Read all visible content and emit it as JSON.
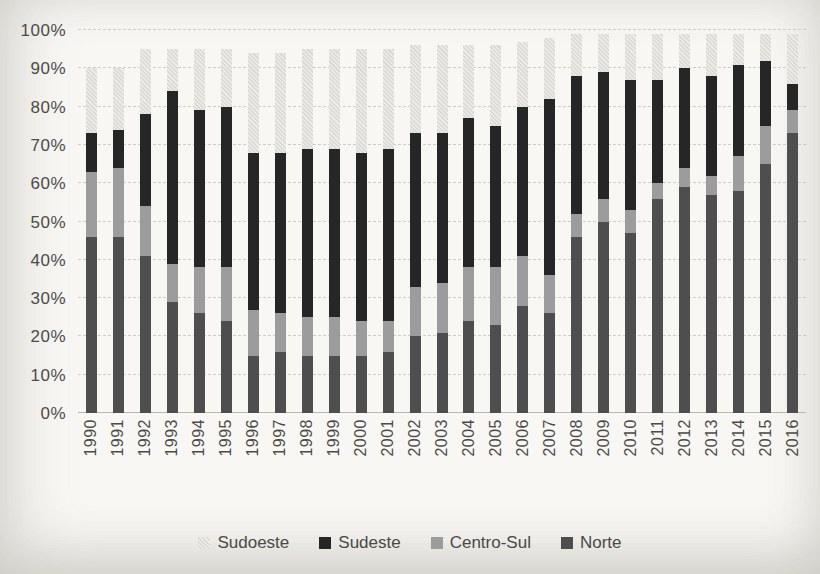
{
  "chart_data": {
    "type": "bar",
    "variant": "stacked-percent",
    "title": "",
    "xlabel": "",
    "ylabel": "",
    "ylim": [
      0,
      100
    ],
    "grid": "horizontal-dashed",
    "legend_position": "bottom",
    "y_ticks": [
      "0%",
      "10%",
      "20%",
      "30%",
      "40%",
      "50%",
      "60%",
      "70%",
      "80%",
      "90%",
      "100%"
    ],
    "categories": [
      "1990",
      "1991",
      "1992",
      "1993",
      "1994",
      "1995",
      "1996",
      "1997",
      "1998",
      "1999",
      "2000",
      "2001",
      "2002",
      "2003",
      "2004",
      "2005",
      "2006",
      "2007",
      "2008",
      "2009",
      "2010",
      "2011",
      "2012",
      "2013",
      "2014",
      "2015",
      "2016"
    ],
    "series": [
      {
        "name": "Norte",
        "color": "#4e4e4e",
        "pattern": "solid",
        "values": [
          46,
          46,
          41,
          29,
          26,
          24,
          15,
          16,
          15,
          15,
          15,
          16,
          20,
          21,
          24,
          23,
          28,
          26,
          46,
          50,
          47,
          56,
          59,
          57,
          58,
          65,
          73
        ]
      },
      {
        "name": "Centro-Sul",
        "color": "#9c9c9c",
        "pattern": "solid",
        "values": [
          17,
          18,
          13,
          10,
          12,
          14,
          12,
          10,
          10,
          10,
          9,
          8,
          13,
          13,
          14,
          15,
          13,
          10,
          6,
          6,
          6,
          4,
          5,
          5,
          9,
          10,
          6
        ]
      },
      {
        "name": "Sudeste",
        "color": "#262626",
        "pattern": "solid",
        "values": [
          10,
          10,
          24,
          45,
          41,
          42,
          41,
          42,
          44,
          44,
          44,
          45,
          40,
          39,
          39,
          37,
          39,
          46,
          36,
          33,
          34,
          27,
          26,
          26,
          24,
          17,
          7
        ]
      },
      {
        "name": "Sudoeste",
        "color": "#e7e5e1",
        "pattern": "stipple",
        "values": [
          17,
          16,
          17,
          11,
          16,
          15,
          26,
          26,
          26,
          26,
          27,
          26,
          23,
          23,
          19,
          21,
          17,
          16,
          11,
          10,
          12,
          12,
          9,
          11,
          8,
          7,
          13
        ]
      }
    ],
    "legend_order": [
      "Sudoeste",
      "Sudeste",
      "Centro-Sul",
      "Norte"
    ]
  },
  "colors": {
    "background": "#f8f7f4",
    "gridline": "#cfcdc8",
    "axis_line": "#b9b7b2",
    "tick_text": "#4c4b49"
  }
}
